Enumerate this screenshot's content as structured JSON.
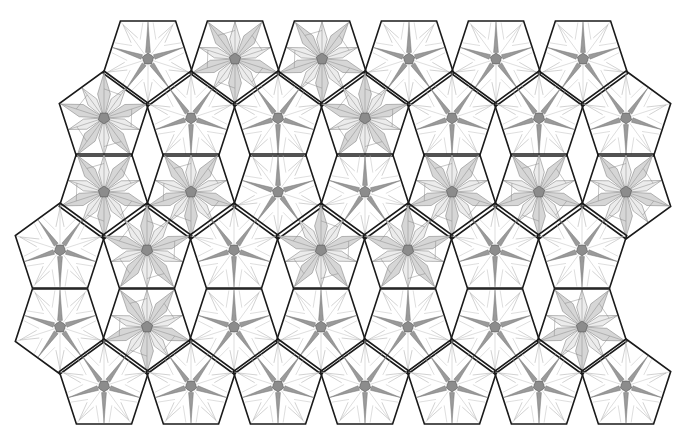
{
  "colors": {
    "background": "#ffffff",
    "outline": "#1a1a1a",
    "thin_line": "#8a8a8a",
    "petal_light": "#ececec",
    "petal_mid": "#d6d6d6",
    "spike_dark": "#9a9a9a",
    "center": "#8c8c8c"
  },
  "geometry": {
    "circumradius": 47,
    "row_pitch_x": 87
  },
  "tiles": {
    "rows": [
      {
        "orientation": "down",
        "cy": 59,
        "cx": [
          148,
          235,
          322,
          409,
          496,
          583
        ],
        "style": [
          "sparse",
          "filled",
          "filled",
          "sparse",
          "sparse",
          "sparse"
        ]
      },
      {
        "orientation": "up",
        "cy": 118,
        "cx": [
          104,
          191,
          278,
          365,
          452,
          539,
          626
        ],
        "style": [
          "filled",
          "sparse",
          "sparse",
          "filled",
          "sparse",
          "sparse",
          "sparse"
        ]
      },
      {
        "orientation": "down",
        "cy": 192,
        "cx": [
          104,
          191,
          278,
          365,
          452,
          539,
          626
        ],
        "style": [
          "filled",
          "filled",
          "sparse",
          "sparse",
          "filled",
          "filled",
          "filled"
        ]
      },
      {
        "orientation": "up",
        "cy": 250,
        "cx": [
          60,
          147,
          234,
          321,
          408,
          495,
          582
        ],
        "style": [
          "sparse",
          "filled",
          "sparse",
          "filled",
          "filled",
          "sparse",
          "sparse"
        ]
      },
      {
        "orientation": "down",
        "cy": 327,
        "cx": [
          60,
          147,
          234,
          321,
          408,
          495,
          582
        ],
        "style": [
          "sparse",
          "filled",
          "sparse",
          "sparse",
          "sparse",
          "sparse",
          "filled"
        ]
      },
      {
        "orientation": "up",
        "cy": 386,
        "cx": [
          104,
          191,
          278,
          365,
          452,
          539,
          626
        ],
        "style": [
          "sparse",
          "sparse",
          "sparse",
          "sparse",
          "sparse",
          "sparse",
          "sparse"
        ]
      }
    ]
  }
}
